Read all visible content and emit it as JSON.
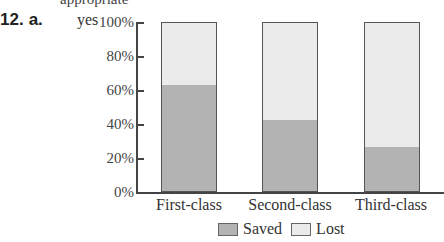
{
  "header": {
    "question_number": "12.",
    "part": "a.",
    "answer": "yes",
    "cut_text": "appropriate"
  },
  "colors": {
    "saved": "#b3b3b3",
    "lost": "#ebebeb",
    "axis": "#444444"
  },
  "chart_data": {
    "type": "bar",
    "stacked": true,
    "normalized": true,
    "title": "",
    "xlabel": "",
    "ylabel": "",
    "ylim": [
      0,
      100
    ],
    "yticks": [
      "0%",
      "20%",
      "40%",
      "60%",
      "80%",
      "100%"
    ],
    "categories": [
      "First-class",
      "Second-class",
      "Third-class"
    ],
    "series": [
      {
        "name": "Saved",
        "values": [
          63,
          42,
          26
        ]
      },
      {
        "name": "Lost",
        "values": [
          37,
          58,
          74
        ]
      }
    ],
    "legend": {
      "position": "bottom",
      "entries": [
        "Saved",
        "Lost"
      ]
    },
    "grid": false
  }
}
